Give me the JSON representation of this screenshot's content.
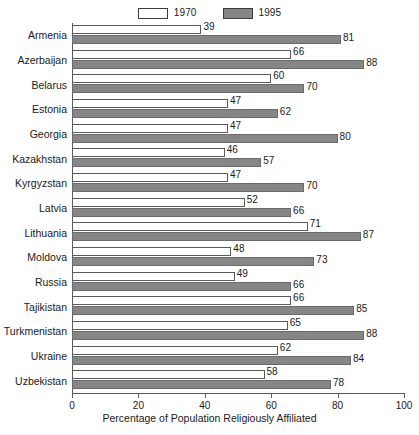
{
  "chart_data": {
    "type": "bar",
    "orientation": "horizontal",
    "title": "",
    "xlabel": "Percentage of Population Religiously Affiliated",
    "ylabel": "",
    "xlim": [
      0,
      100
    ],
    "xticks": [
      0,
      20,
      40,
      60,
      80,
      100
    ],
    "xtick_labels": [
      "0",
      "20",
      "40",
      "60",
      "80",
      "100"
    ],
    "grid": false,
    "legend_position": "top-center",
    "categories": [
      "Armenia",
      "Azerbaijan",
      "Belarus",
      "Estonia",
      "Georgia",
      "Kazakhstan",
      "Kyrgyzstan",
      "Latvia",
      "Lithuania",
      "Moldova",
      "Russia",
      "Tajikistan",
      "Turkmenistan",
      "Ukraine",
      "Uzbekistan"
    ],
    "series": [
      {
        "name": "1970",
        "color": "#ffffff",
        "border_color": "#5a5a5a",
        "values": [
          39,
          66,
          60,
          47,
          47,
          46,
          47,
          52,
          71,
          48,
          49,
          66,
          65,
          62,
          58
        ]
      },
      {
        "name": "1995",
        "color": "#868686",
        "border_color": "#6b6b6b",
        "values": [
          81,
          88,
          70,
          62,
          80,
          57,
          70,
          66,
          87,
          73,
          66,
          85,
          88,
          84,
          78
        ]
      }
    ]
  },
  "legend": {
    "entries": [
      {
        "label": "1970"
      },
      {
        "label": "1995"
      }
    ]
  }
}
